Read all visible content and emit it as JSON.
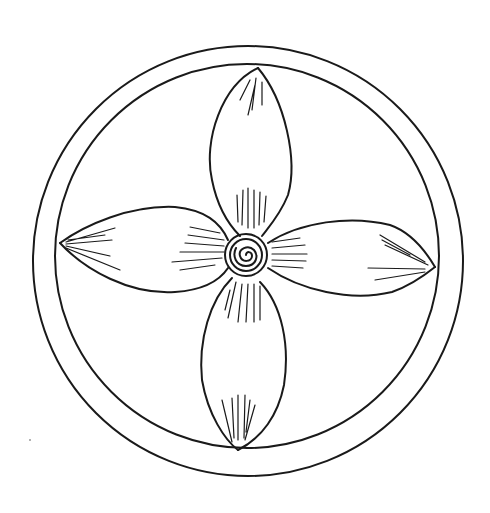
{
  "figure": {
    "colors": {
      "stroke": "#1a1a1a",
      "background": "#ffffff"
    },
    "outer_circle": {
      "cx": 248,
      "cy": 260,
      "r": 215
    },
    "inner_circle": {
      "cx": 248,
      "cy": 256,
      "r": 192
    },
    "center_spiral": {
      "cx": 246,
      "cy": 255,
      "r": 20
    },
    "petals": [
      "top",
      "right",
      "bottom",
      "left"
    ]
  }
}
